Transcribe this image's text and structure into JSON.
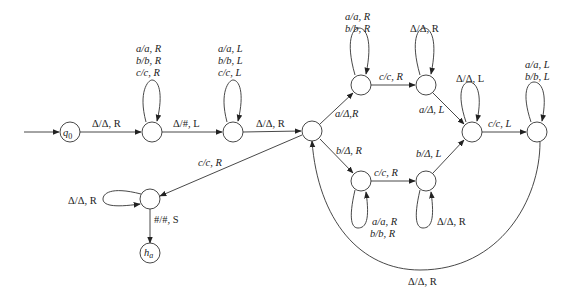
{
  "diagram": {
    "type": "turing-machine-state-diagram",
    "states": [
      {
        "id": "q0",
        "label": "q0",
        "display": {
          "main": "q",
          "sub": "0"
        },
        "x": 70,
        "y": 132,
        "initial": true
      },
      {
        "id": "s1",
        "label": "",
        "x": 152,
        "y": 132
      },
      {
        "id": "s2",
        "label": "",
        "x": 233,
        "y": 132
      },
      {
        "id": "s3",
        "label": "",
        "x": 312,
        "y": 131
      },
      {
        "id": "s4",
        "label": "",
        "x": 361,
        "y": 85
      },
      {
        "id": "s5",
        "label": "",
        "x": 426,
        "y": 85
      },
      {
        "id": "s6",
        "label": "",
        "x": 361,
        "y": 181
      },
      {
        "id": "s7",
        "label": "",
        "x": 426,
        "y": 181
      },
      {
        "id": "s8",
        "label": "",
        "x": 472,
        "y": 132
      },
      {
        "id": "s9",
        "label": "",
        "x": 537,
        "y": 132
      },
      {
        "id": "s10",
        "label": "",
        "x": 150,
        "y": 199
      },
      {
        "id": "ha",
        "label": "ha",
        "display": {
          "main": "h",
          "sub": "a"
        },
        "x": 150,
        "y": 253,
        "halting": true
      }
    ],
    "transitions": [
      {
        "from": "q0",
        "to": "s1",
        "label": "Δ/Δ, R"
      },
      {
        "from": "s1",
        "to": "s1",
        "label_lines": [
          "a/a, R",
          "b/b, R",
          "c/c, R"
        ]
      },
      {
        "from": "s1",
        "to": "s2",
        "label": "Δ/#, L"
      },
      {
        "from": "s2",
        "to": "s2",
        "label_lines": [
          "a/a, L",
          "b/b, L",
          "c/c, L"
        ]
      },
      {
        "from": "s2",
        "to": "s3",
        "label": "Δ/Δ, R"
      },
      {
        "from": "s3",
        "to": "s4",
        "label": "a/Δ,R"
      },
      {
        "from": "s4",
        "to": "s4",
        "label_lines": [
          "a/a, R",
          "b/b, R"
        ]
      },
      {
        "from": "s4",
        "to": "s5",
        "label": "c/c, R"
      },
      {
        "from": "s5",
        "to": "s5",
        "label": "Δ/Δ, R"
      },
      {
        "from": "s5",
        "to": "s8",
        "label": "a/Δ, L"
      },
      {
        "from": "s3",
        "to": "s6",
        "label": "b/Δ, R"
      },
      {
        "from": "s6",
        "to": "s6",
        "label_lines": [
          "a/a, R",
          "b/b, R"
        ]
      },
      {
        "from": "s6",
        "to": "s7",
        "label": "c/c, R"
      },
      {
        "from": "s7",
        "to": "s7",
        "label": "Δ/Δ, R"
      },
      {
        "from": "s7",
        "to": "s8",
        "label": "b/Δ, L"
      },
      {
        "from": "s8",
        "to": "s8",
        "label": "Δ/Δ, L"
      },
      {
        "from": "s8",
        "to": "s9",
        "label": "c/c, L"
      },
      {
        "from": "s9",
        "to": "s9",
        "label_lines": [
          "a/a, L",
          "b/b, L"
        ]
      },
      {
        "from": "s9",
        "to": "s3",
        "label": "Δ/Δ, R"
      },
      {
        "from": "s3",
        "to": "s10",
        "label": "c/c, R"
      },
      {
        "from": "s10",
        "to": "s10",
        "label": "Δ/Δ, R"
      },
      {
        "from": "s10",
        "to": "ha",
        "label": "#/#, S"
      }
    ]
  },
  "labels": {
    "q0_main": "q",
    "q0_sub": "0",
    "ha_main": "h",
    "ha_sub": "a",
    "t_q0_s1": "Δ/Δ, R",
    "t_s1_loop_1": "a/a, R",
    "t_s1_loop_2": "b/b, R",
    "t_s1_loop_3": "c/c, R",
    "t_s1_s2": "Δ/#, L",
    "t_s2_loop_1": "a/a, L",
    "t_s2_loop_2": "b/b, L",
    "t_s2_loop_3": "c/c, L",
    "t_s2_s3": "Δ/Δ, R",
    "t_s3_s4": "a/Δ,R",
    "t_s4_loop_1": "a/a, R",
    "t_s4_loop_2": "b/b, R",
    "t_s4_s5": "c/c, R",
    "t_s5_loop": "Δ/Δ, R",
    "t_s5_s8": "a/Δ, L",
    "t_s3_s6": "b/Δ, R",
    "t_s6_loop_1": "a/a, R",
    "t_s6_loop_2": "b/b, R",
    "t_s6_s7": "c/c, R",
    "t_s7_loop": "Δ/Δ, R",
    "t_s7_s8": "b/Δ, L",
    "t_s8_loop": "Δ/Δ, L",
    "t_s8_s9": "c/c, L",
    "t_s9_loop_1": "a/a, L",
    "t_s9_loop_2": "b/b, L",
    "t_s9_s3": "Δ/Δ, R",
    "t_s3_s10": "c/c, R",
    "t_s10_loop": "Δ/Δ, R",
    "t_s10_ha": "#/#, S"
  }
}
